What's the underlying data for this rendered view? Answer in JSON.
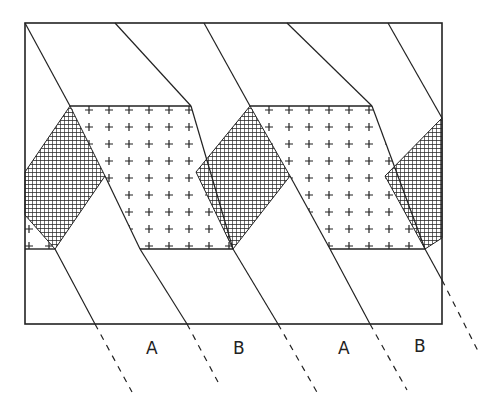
{
  "diagram": {
    "labels": [
      {
        "text": "A",
        "x": 146,
        "y": 338
      },
      {
        "text": "B",
        "x": 233,
        "y": 338
      },
      {
        "text": "A",
        "x": 338,
        "y": 338
      },
      {
        "text": "B",
        "x": 414,
        "y": 336
      }
    ],
    "colors": {
      "ink": "#222222",
      "paper": "#ffffff"
    },
    "patterns": [
      "cross-hatch",
      "plus-marks"
    ]
  }
}
